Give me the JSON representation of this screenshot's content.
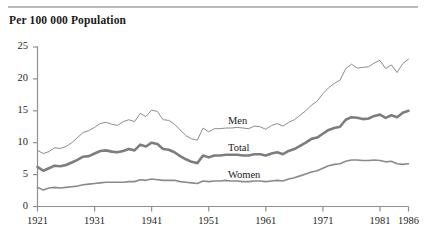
{
  "chart_data": {
    "type": "line",
    "title": "Per 100 000 Population",
    "xlabel": "",
    "ylabel": "",
    "xlim": [
      1921,
      1986
    ],
    "ylim": [
      0,
      25
    ],
    "yticks": [
      0,
      5,
      10,
      15,
      20,
      25
    ],
    "xticks": [
      1921,
      1931,
      1941,
      1951,
      1961,
      1971,
      1981,
      1986
    ],
    "grid": false,
    "legend_position": "inline-annotations",
    "x": [
      1921,
      1922,
      1923,
      1924,
      1925,
      1926,
      1927,
      1928,
      1929,
      1930,
      1931,
      1932,
      1933,
      1934,
      1935,
      1936,
      1937,
      1938,
      1939,
      1940,
      1941,
      1942,
      1943,
      1944,
      1945,
      1946,
      1947,
      1948,
      1949,
      1950,
      1951,
      1952,
      1953,
      1954,
      1955,
      1956,
      1957,
      1958,
      1959,
      1960,
      1961,
      1962,
      1963,
      1964,
      1965,
      1966,
      1967,
      1968,
      1969,
      1970,
      1971,
      1972,
      1973,
      1974,
      1975,
      1976,
      1977,
      1978,
      1979,
      1980,
      1981,
      1982,
      1983,
      1984,
      1985,
      1986
    ],
    "series": [
      {
        "name": "Men",
        "color": "#8c8c8c",
        "line_width": 1.0,
        "values": [
          8.8,
          8.3,
          8.6,
          9.2,
          9.1,
          9.4,
          10.0,
          10.8,
          11.6,
          11.9,
          12.4,
          13.0,
          13.2,
          12.9,
          12.7,
          13.3,
          13.6,
          13.3,
          14.6,
          14.1,
          15.1,
          14.9,
          13.6,
          13.5,
          12.9,
          12.0,
          11.1,
          10.6,
          10.4,
          12.3,
          11.7,
          12.2,
          12.2,
          12.3,
          12.3,
          12.4,
          12.3,
          12.2,
          12.6,
          12.5,
          12.1,
          12.7,
          13.0,
          12.6,
          13.2,
          13.6,
          14.3,
          15.0,
          15.9,
          16.5,
          17.7,
          18.6,
          19.3,
          19.8,
          21.6,
          22.3,
          21.7,
          21.8,
          21.9,
          22.5,
          22.9,
          21.6,
          22.2,
          21.0,
          22.4,
          23.1
        ]
      },
      {
        "name": "Total",
        "color": "#7d7d7d",
        "line_width": 2.6,
        "values": [
          6.2,
          5.6,
          6.0,
          6.4,
          6.3,
          6.5,
          6.9,
          7.3,
          7.8,
          7.9,
          8.3,
          8.7,
          8.8,
          8.6,
          8.5,
          8.7,
          9.0,
          8.8,
          9.7,
          9.4,
          10.0,
          9.8,
          9.0,
          8.9,
          8.5,
          7.9,
          7.4,
          7.0,
          6.8,
          8.0,
          7.7,
          8.0,
          8.0,
          8.1,
          8.1,
          8.1,
          8.0,
          8.0,
          8.2,
          8.2,
          8.0,
          8.3,
          8.5,
          8.2,
          8.7,
          9.0,
          9.5,
          10.0,
          10.6,
          10.8,
          11.4,
          12.0,
          12.3,
          12.5,
          13.6,
          14.0,
          13.9,
          13.7,
          13.8,
          14.2,
          14.4,
          13.9,
          14.3,
          14.0,
          14.7,
          15.0
        ]
      },
      {
        "name": "Women",
        "color": "#8a8a8a",
        "line_width": 1.6,
        "values": [
          3.0,
          2.6,
          2.9,
          3.0,
          2.9,
          3.0,
          3.1,
          3.2,
          3.4,
          3.5,
          3.6,
          3.7,
          3.8,
          3.8,
          3.8,
          3.8,
          3.9,
          3.9,
          4.2,
          4.1,
          4.3,
          4.2,
          4.1,
          4.1,
          4.1,
          3.9,
          3.8,
          3.7,
          3.6,
          4.0,
          3.9,
          4.0,
          4.0,
          4.1,
          4.0,
          4.0,
          3.9,
          3.9,
          4.0,
          4.0,
          3.9,
          4.0,
          4.1,
          4.0,
          4.3,
          4.5,
          4.8,
          5.1,
          5.4,
          5.6,
          6.0,
          6.4,
          6.6,
          6.7,
          7.1,
          7.3,
          7.3,
          7.2,
          7.2,
          7.3,
          7.2,
          7.0,
          7.1,
          6.7,
          6.6,
          6.7
        ]
      }
    ],
    "annotations": [
      {
        "text": "Men",
        "x": 1957,
        "y": 13.4
      },
      {
        "text": "Total",
        "x": 1957,
        "y": 9.1
      },
      {
        "text": "Women",
        "x": 1957,
        "y": 4.9
      }
    ]
  },
  "axis": {
    "y_labels": [
      "25",
      "20",
      "15",
      "10",
      "5",
      "0"
    ],
    "x_labels": [
      "1921",
      "1931",
      "1941",
      "1951",
      "1961",
      "1971",
      "1981",
      "1986"
    ]
  }
}
